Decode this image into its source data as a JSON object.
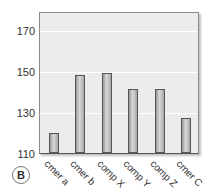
{
  "panel_label": "B",
  "chart_data": {
    "type": "bar",
    "title": "",
    "xlabel": "",
    "ylabel": "",
    "categories": [
      "cmer a",
      "cmer b",
      "comp X",
      "comp Y",
      "comp Z",
      "cmer C"
    ],
    "values": [
      120,
      148,
      149,
      141,
      141,
      127
    ],
    "ylim": [
      110,
      179
    ],
    "yticks": [
      "110",
      "130",
      "150",
      "170"
    ],
    "grid": true,
    "legend": null
  }
}
